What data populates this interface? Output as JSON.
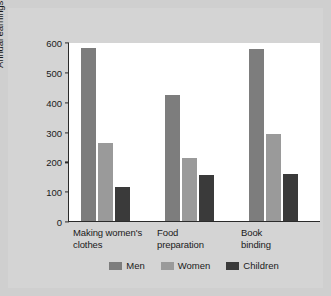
{
  "chart_data": {
    "type": "bar",
    "title": "",
    "xlabel": "",
    "ylabel": "Annual earnings (in dollars)",
    "ylim": [
      0,
      600
    ],
    "yticks": [
      "0",
      "100",
      "200",
      "300",
      "400",
      "500",
      "600"
    ],
    "grid": false,
    "legend_position": "bottom",
    "categories": [
      "Making women's\nclothes",
      "Food\npreparation",
      "Book\nbinding"
    ],
    "series": [
      {
        "name": "Men",
        "color": "#7d7d7d",
        "values": [
          580,
          422,
          575
        ]
      },
      {
        "name": "Women",
        "color": "#9a9a9a",
        "values": [
          263,
          211,
          290
        ]
      },
      {
        "name": "Children",
        "color": "#3a3a3a",
        "values": [
          114,
          154,
          157
        ]
      }
    ]
  },
  "figure": {
    "background_color": "#cfcfcf",
    "plot_background_color": "#ffffff",
    "axis_color": "#2b2b2b"
  }
}
